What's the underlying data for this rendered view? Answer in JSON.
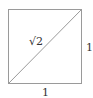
{
  "diagram": {
    "shape": "unit square with diagonal",
    "diagonal_label": "√2",
    "side_right_label": "1",
    "side_bottom_label": "1",
    "colors": {
      "stroke": "#9a9a9a",
      "text": "#333333"
    }
  }
}
